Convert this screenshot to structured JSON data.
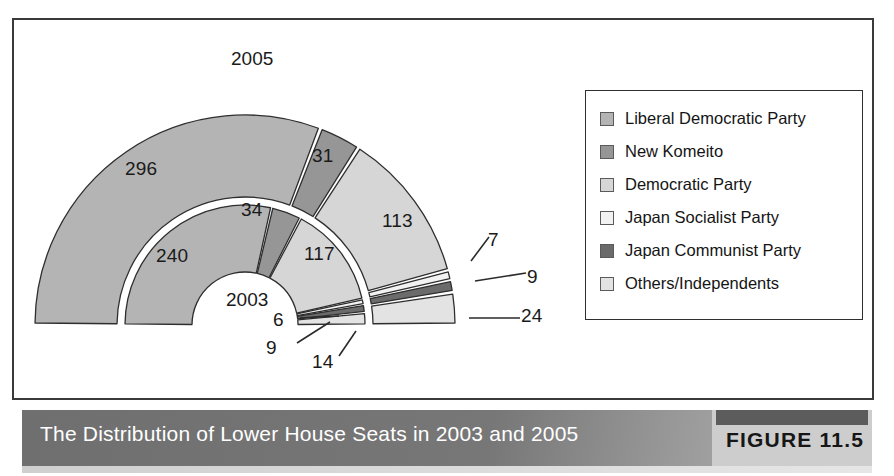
{
  "figure": {
    "caption": "The Distribution of Lower House Seats in 2003 and 2005",
    "figure_number": "FIGURE 11.5"
  },
  "legend": {
    "items": [
      {
        "label": "Liberal Democratic Party",
        "color": "#b4b4b4"
      },
      {
        "label": "New Komeito",
        "color": "#969696"
      },
      {
        "label": "Democratic Party",
        "color": "#d6d6d6"
      },
      {
        "label": "Japan Socialist Party",
        "color": "#f2f2f2"
      },
      {
        "label": "Japan Communist Party",
        "color": "#6b6b6b"
      },
      {
        "label": "Others/Independents",
        "color": "#e3e3e3"
      }
    ]
  },
  "ring_labels": {
    "outer_year": "2005",
    "inner_year": "2003"
  },
  "chart_data": {
    "type": "pie",
    "title": "The Distribution of Lower House Seats in 2003 and 2005",
    "subtype": "nested half-donut (two concentric rings)",
    "categories": [
      "Liberal Democratic Party",
      "New Komeito",
      "Democratic Party",
      "Japan Socialist Party",
      "Japan Communist Party",
      "Others/Independents"
    ],
    "colors": [
      "#b4b4b4",
      "#969696",
      "#d6d6d6",
      "#f2f2f2",
      "#6b6b6b",
      "#e3e3e3"
    ],
    "series": [
      {
        "name": "2005",
        "ring": "outer",
        "values": [
          296,
          31,
          113,
          7,
          9,
          24
        ],
        "total": 480
      },
      {
        "name": "2003",
        "ring": "inner",
        "values": [
          240,
          34,
          117,
          6,
          9,
          14
        ],
        "total": 420
      }
    ],
    "legend_position": "right",
    "grid": false,
    "xlabel": "",
    "ylabel": ""
  },
  "annotations": {
    "outer": [
      {
        "value": "296",
        "x": 125,
        "y": 158
      },
      {
        "value": "31",
        "x": 312,
        "y": 145
      },
      {
        "value": "113",
        "x": 382,
        "y": 210
      },
      {
        "value": "7",
        "x": 488,
        "y": 229
      },
      {
        "value": "9",
        "x": 527,
        "y": 266
      },
      {
        "value": "24",
        "x": 521,
        "y": 305
      }
    ],
    "inner": [
      {
        "value": "240",
        "x": 156,
        "y": 245
      },
      {
        "value": "34",
        "x": 241,
        "y": 199
      },
      {
        "value": "117",
        "x": 304,
        "y": 243
      },
      {
        "value": "6",
        "x": 273,
        "y": 309
      },
      {
        "value": "9",
        "x": 266,
        "y": 337
      },
      {
        "value": "14",
        "x": 312,
        "y": 351
      }
    ],
    "years": [
      {
        "value": "2005",
        "x": 231,
        "y": 48
      },
      {
        "value": "2003",
        "x": 226,
        "y": 289
      }
    ]
  }
}
